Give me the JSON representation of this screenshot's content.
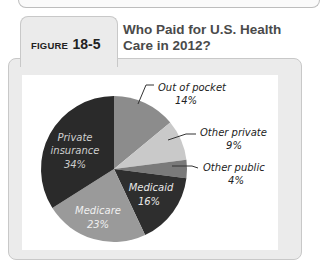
{
  "figure": {
    "label_word": "FIGURE",
    "label_number": "18-5",
    "title_line1": "Who Paid for U.S. Health",
    "title_line2": "Care in 2012?"
  },
  "chart_data": {
    "type": "pie",
    "title": "Who Paid for U.S. Health Care in 2012?",
    "categories": [
      "Out of pocket",
      "Other private",
      "Other public",
      "Medicaid",
      "Medicare",
      "Private insurance"
    ],
    "values": [
      14,
      9,
      4,
      16,
      23,
      34
    ],
    "unit": "%",
    "colors": {
      "Out of pocket": "#8c8c8c",
      "Other private": "#c9c9c9",
      "Other public": "#7a7a7a",
      "Medicaid": "#2e2e2e",
      "Medicare": "#9a9a9a",
      "Private insurance": "#2a2a2a"
    },
    "labels": [
      {
        "name": "Out of pocket",
        "value": "14%",
        "position": "outside"
      },
      {
        "name": "Other private",
        "value": "9%",
        "position": "outside"
      },
      {
        "name": "Other public",
        "value": "4%",
        "position": "outside"
      },
      {
        "name": "Medicaid",
        "value": "16%",
        "position": "inside"
      },
      {
        "name": "Medicare",
        "value": "23%",
        "position": "inside"
      },
      {
        "name": "Private insurance",
        "value": "34%",
        "position": "inside"
      }
    ],
    "legend": "none (direct labels)"
  },
  "labels": {
    "oop_name": "Out of pocket",
    "oop_val": "14%",
    "op_name": "Other private",
    "op_val": "9%",
    "opub_name": "Other public",
    "opub_val": "4%",
    "medicaid_name": "Medicaid",
    "medicaid_val": "16%",
    "medicare_name": "Medicare",
    "medicare_val": "23%",
    "pi_name1": "Private",
    "pi_name2": "insurance",
    "pi_val": "34%"
  }
}
